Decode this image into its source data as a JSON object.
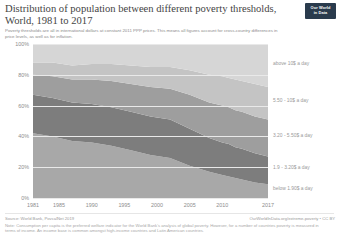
{
  "header": {
    "title": "Distribution of population between different poverty thresholds, World, 1981 to 2017",
    "subtitle": "Poverty thresholds are all in international dollars at constant 2011 PPP prices. This means all figures account for cross-country differences in price levels, as well as for inflation.",
    "logo_line1": "Our World",
    "logo_line2": "in Data"
  },
  "footer": {
    "source": "Source: World Bank, PovcalNet 2019",
    "license": "OurWorldInData.org/extreme-poverty • CC BY",
    "note": "Note: Consumption per capita is the preferred welfare indicator for the World Bank's analysis of global poverty. However, for a number of countries poverty is measured in terms of income. An income base is common amongst high-income countries and Latin American countries."
  },
  "chart_data": {
    "type": "area",
    "title": "Distribution of population between different poverty thresholds, World, 1981 to 2017",
    "xlabel": "",
    "ylabel": "",
    "ylim": [
      0,
      100
    ],
    "xlim": [
      1981,
      2017
    ],
    "grid": true,
    "legend_position": "right",
    "stacked": true,
    "x": [
      1981,
      1984,
      1987,
      1990,
      1993,
      1996,
      1999,
      2002,
      2005,
      2008,
      2010,
      2011,
      2012,
      2013,
      2015,
      2017
    ],
    "ytick_labels": [
      "100%",
      "80%",
      "60%",
      "40%",
      "20%",
      "0%"
    ],
    "ytick_values": [
      100,
      80,
      60,
      40,
      20,
      0
    ],
    "xtick_labels": [
      "1981",
      "1985",
      "1990",
      "1995",
      "2000",
      "2005",
      "2010",
      "2017"
    ],
    "xtick_values": [
      1981,
      1985,
      1990,
      1995,
      2000,
      2005,
      2010,
      2017
    ],
    "series": [
      {
        "name": "below 1.90$ a day",
        "label": "below 1.90$ a day",
        "color": "#a8a8a8",
        "values": [
          42,
          40,
          37,
          36,
          34,
          31,
          28,
          26,
          21,
          17,
          15,
          14,
          13,
          12,
          10,
          9
        ]
      },
      {
        "name": "1.9 - 3.20$ a day",
        "label": "1.9 - 3.20$ a day",
        "color": "#7d7d7d",
        "values": [
          25,
          25,
          25,
          25,
          25,
          25,
          25,
          25,
          24,
          22,
          21,
          21,
          20,
          20,
          19,
          18
        ]
      },
      {
        "name": "3.20 - 5.50$ a day",
        "label": "3.20 - 5.50$ a day",
        "color": "#9e9e9e",
        "values": [
          13,
          14,
          15,
          16,
          17,
          18,
          19,
          20,
          22,
          23,
          24,
          24,
          24,
          24,
          24,
          24
        ]
      },
      {
        "name": "5.50 - 10$ a day",
        "label": "5.50 - 10$ a day",
        "color": "#c4c4c4",
        "values": [
          8,
          9,
          9,
          10,
          11,
          12,
          13,
          14,
          16,
          18,
          19,
          19,
          20,
          20,
          21,
          21
        ]
      },
      {
        "name": "above 10$ a day",
        "label": "above 10$ a day",
        "color": "#d6d6d6",
        "values": [
          12,
          12,
          14,
          13,
          13,
          14,
          15,
          15,
          17,
          20,
          21,
          22,
          23,
          24,
          26,
          28
        ]
      }
    ]
  }
}
